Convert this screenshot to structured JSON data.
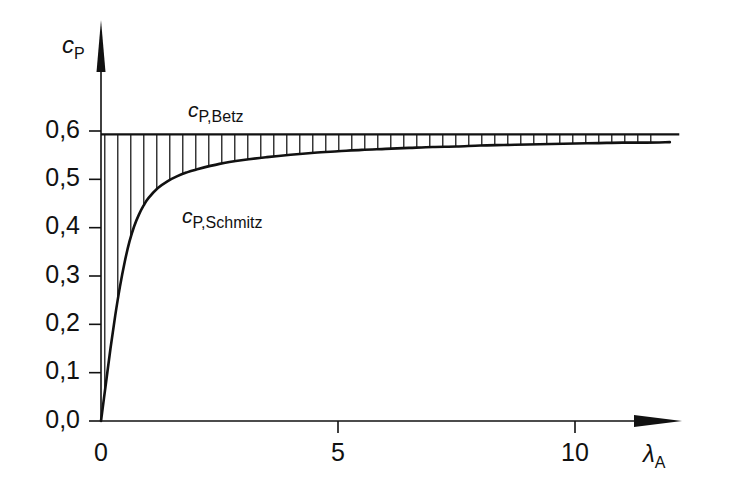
{
  "figure": {
    "background_color": "#ffffff",
    "line_color": "#111111"
  },
  "axes": {
    "y_axis_title": "c",
    "y_axis_title_sub": "P",
    "x_axis_title": "λ",
    "x_axis_title_sub": "A"
  },
  "labels": {
    "betz": {
      "main": "c",
      "sub": "P,Betz"
    },
    "schmitz": {
      "main": "c",
      "sub": "P,Schmitz"
    }
  },
  "chart_data": {
    "type": "line",
    "title": "",
    "subtitle": "",
    "xlabel": "λ_A",
    "ylabel": "c_P",
    "xlim": [
      0,
      12.2
    ],
    "ylim": [
      0,
      0.66
    ],
    "grid": false,
    "legend_position": "inline-annotations",
    "x_ticks": [
      0,
      5,
      10
    ],
    "x_tick_labels": [
      "0",
      "5",
      "10"
    ],
    "y_ticks": [
      0.0,
      0.1,
      0.2,
      0.3,
      0.4,
      0.5,
      0.6
    ],
    "y_tick_labels": [
      "0,0",
      "0,1",
      "0,2",
      "0,3",
      "0,4",
      "0,5",
      "0,6"
    ],
    "annotations": [
      {
        "text": "c_P,Betz",
        "x": 1.85,
        "y": 0.635
      },
      {
        "text": "c_P,Schmitz",
        "x": 1.72,
        "y": 0.455
      }
    ],
    "shading": {
      "type": "vertical-hatch",
      "between": [
        "c_P,Betz",
        "c_P,Schmitz"
      ],
      "x_from": 0.08,
      "x_to": 11.7,
      "spacing_px": 13
    },
    "series": [
      {
        "name": "c_P,Betz",
        "style": "horizontal-line",
        "constant_value": 0.593,
        "x": [
          0,
          12.2
        ],
        "values": [
          0.593,
          0.593
        ]
      },
      {
        "name": "c_P,Schmitz",
        "style": "curve",
        "x": [
          0.0,
          0.1,
          0.2,
          0.3,
          0.4,
          0.5,
          0.6,
          0.7,
          0.8,
          0.9,
          1.0,
          1.2,
          1.4,
          1.6,
          1.8,
          2.0,
          2.5,
          3.0,
          3.5,
          4.0,
          4.5,
          5.0,
          5.5,
          6.0,
          6.5,
          7.0,
          7.5,
          8.0,
          8.5,
          9.0,
          9.5,
          10.0,
          10.5,
          11.0,
          11.5,
          12.0
        ],
        "values": [
          0.0,
          0.075,
          0.15,
          0.218,
          0.278,
          0.329,
          0.371,
          0.403,
          0.427,
          0.446,
          0.461,
          0.482,
          0.496,
          0.506,
          0.514,
          0.52,
          0.532,
          0.54,
          0.546,
          0.551,
          0.555,
          0.558,
          0.561,
          0.563,
          0.565,
          0.567,
          0.568,
          0.57,
          0.571,
          0.572,
          0.573,
          0.574,
          0.575,
          0.576,
          0.576,
          0.577
        ]
      }
    ]
  }
}
